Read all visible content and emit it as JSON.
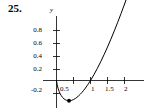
{
  "problem": {
    "number": "25."
  },
  "chart_data": {
    "type": "line",
    "title": "",
    "xlabel": "",
    "ylabel": "y",
    "function": "y = x ln x",
    "grid": false,
    "legend": false,
    "xlim": [
      -0.12,
      2.38
    ],
    "ylim": [
      -0.32,
      1.0
    ],
    "x_ticks": [
      0.5,
      1,
      1.5,
      2
    ],
    "x_tick_labels": [
      "0.5",
      "1",
      "1.5",
      "2"
    ],
    "y_ticks": [
      -0.2,
      0.2,
      0.4,
      0.6,
      0.8
    ],
    "y_tick_labels": [
      "-0.2",
      "0.2",
      "0.4",
      "0.6",
      "0.8"
    ],
    "axis_label_y": "y",
    "points": [
      {
        "x": 0.0,
        "y": 0.0
      },
      {
        "x": 0.02,
        "y": -0.078
      },
      {
        "x": 0.05,
        "y": -0.15
      },
      {
        "x": 0.08,
        "y": -0.202
      },
      {
        "x": 0.11,
        "y": -0.243
      },
      {
        "x": 0.14,
        "y": -0.275
      },
      {
        "x": 0.18,
        "y": -0.309
      },
      {
        "x": 0.22,
        "y": -0.333
      },
      {
        "x": 0.26,
        "y": -0.35
      },
      {
        "x": 0.3,
        "y": -0.361
      },
      {
        "x": 0.34,
        "y": -0.367
      },
      {
        "x": 0.368,
        "y": -0.3679
      },
      {
        "x": 0.4,
        "y": -0.3665
      },
      {
        "x": 0.45,
        "y": -0.3594
      },
      {
        "x": 0.5,
        "y": -0.3466
      },
      {
        "x": 0.55,
        "y": -0.3288
      },
      {
        "x": 0.6,
        "y": -0.3065
      },
      {
        "x": 0.65,
        "y": -0.28
      },
      {
        "x": 0.7,
        "y": -0.2497
      },
      {
        "x": 0.75,
        "y": -0.2158
      },
      {
        "x": 0.8,
        "y": -0.1785
      },
      {
        "x": 0.85,
        "y": -0.1382
      },
      {
        "x": 0.9,
        "y": -0.0948
      },
      {
        "x": 0.95,
        "y": -0.0487
      },
      {
        "x": 1.0,
        "y": 0.0
      },
      {
        "x": 1.1,
        "y": 0.1048
      },
      {
        "x": 1.2,
        "y": 0.2188
      },
      {
        "x": 1.3,
        "y": 0.3411
      },
      {
        "x": 1.4,
        "y": 0.4711
      },
      {
        "x": 1.5,
        "y": 0.6082
      },
      {
        "x": 1.6,
        "y": 0.752
      },
      {
        "x": 1.7,
        "y": 0.9021
      },
      {
        "x": 1.8,
        "y": 1.058
      },
      {
        "x": 1.9,
        "y": 1.2196
      },
      {
        "x": 2.0,
        "y": 1.3863
      }
    ],
    "markers": [
      {
        "x": 0.368,
        "y": -0.368,
        "style": "filled-circle",
        "label": "minimum"
      }
    ],
    "zero_crossing": {
      "x": 1,
      "y": 0
    },
    "colors": {
      "curve": "#000000",
      "axis": "#000000",
      "marker": "#000000",
      "background": "#ffffff"
    }
  }
}
